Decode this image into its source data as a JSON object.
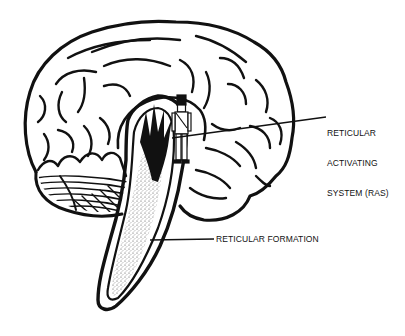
{
  "figure": {
    "colors": {
      "ink": "#111111",
      "paper": "#ffffff",
      "stipple": "#555555"
    }
  },
  "labels": {
    "ras": {
      "line1": "RETICULAR",
      "line2": "ACTIVATING",
      "line3": "SYSTEM (RAS)"
    },
    "reticular_formation": "RETICULAR FORMATION"
  }
}
